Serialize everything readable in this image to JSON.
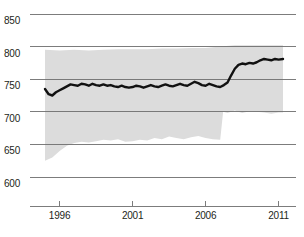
{
  "chart_data": {
    "type": "line",
    "title": "",
    "subtitle": "",
    "xlabel": "",
    "ylabel": "",
    "xlim": [
      1994.0,
      2011.6
    ],
    "ylim": [
      585,
      862
    ],
    "grid": true,
    "grid_axis": "y",
    "legend": false,
    "legend_position": "none",
    "colors": {
      "line": "#111111",
      "band_fill": "#dcdcdc",
      "gridline": "#6e6e6e",
      "axis": "#6e6e6e",
      "text": "#231f20",
      "background": "#ffffff"
    },
    "yticks": [
      600,
      650,
      700,
      750,
      800,
      850
    ],
    "ytick_labels": [
      "600",
      "650",
      "700",
      "750",
      "800",
      "850"
    ],
    "xticks": [
      1996,
      2001,
      2006,
      2011
    ],
    "xtick_labels": [
      "1996",
      "2001",
      "2006",
      "2011"
    ],
    "series": [
      {
        "name": "mean",
        "kind": "line",
        "x": [
          1995.0,
          1995.25,
          1995.5,
          1995.75,
          1996.0,
          1996.25,
          1996.5,
          1996.75,
          1997.0,
          1997.25,
          1997.5,
          1997.75,
          1998.0,
          1998.25,
          1998.5,
          1998.75,
          1999.0,
          1999.25,
          1999.5,
          1999.75,
          2000.0,
          2000.25,
          2000.5,
          2000.75,
          2001.0,
          2001.25,
          2001.5,
          2001.75,
          2002.0,
          2002.25,
          2002.5,
          2002.75,
          2003.0,
          2003.25,
          2003.5,
          2003.75,
          2004.0,
          2004.25,
          2004.5,
          2004.75,
          2005.0,
          2005.25,
          2005.5,
          2005.75,
          2006.0,
          2006.25,
          2006.5,
          2006.75,
          2007.0,
          2007.25,
          2007.5,
          2007.75,
          2008.0,
          2008.25,
          2008.5,
          2008.75,
          2009.0,
          2009.25,
          2009.5,
          2009.75,
          2010.0,
          2010.25,
          2010.5,
          2010.75,
          2011.0,
          2011.3
        ],
        "values": [
          735,
          727,
          725,
          730,
          733,
          736,
          739,
          742,
          741,
          740,
          743,
          742,
          740,
          743,
          741,
          740,
          742,
          740,
          741,
          739,
          738,
          740,
          738,
          737,
          738,
          740,
          739,
          737,
          739,
          741,
          739,
          738,
          740,
          742,
          740,
          739,
          741,
          743,
          741,
          740,
          743,
          746,
          744,
          741,
          740,
          743,
          741,
          739,
          738,
          741,
          745,
          756,
          766,
          772,
          774,
          773,
          775,
          774,
          776,
          779,
          781,
          780,
          779,
          781,
          780,
          781
        ]
      },
      {
        "name": "upper_band",
        "kind": "band_upper",
        "x": [
          1995.0,
          1996.0,
          1997.0,
          1998.0,
          1999.0,
          2000.0,
          2001.0,
          2002.0,
          2003.0,
          2004.0,
          2005.0,
          2006.0,
          2007.0,
          2008.0,
          2009.0,
          2010.0,
          2011.3
        ],
        "values": [
          795,
          794,
          795,
          794,
          795,
          796,
          796,
          796,
          797,
          797,
          798,
          798,
          800,
          802,
          802,
          802,
          802
        ]
      },
      {
        "name": "lower_band",
        "kind": "band_lower",
        "x": [
          1995.0,
          1995.5,
          1996.0,
          1996.5,
          1997.0,
          1997.5,
          1998.0,
          1998.5,
          1999.0,
          1999.5,
          2000.0,
          2000.5,
          2001.0,
          2001.5,
          2002.0,
          2002.5,
          2003.0,
          2003.5,
          2004.0,
          2004.5,
          2005.0,
          2005.5,
          2006.0,
          2006.5,
          2007.0,
          2007.2,
          2007.5,
          2008.0,
          2008.5,
          2009.0,
          2009.5,
          2010.0,
          2010.5,
          2011.0,
          2011.3
        ],
        "values": [
          625,
          630,
          640,
          648,
          652,
          654,
          653,
          655,
          657,
          656,
          658,
          654,
          655,
          657,
          656,
          660,
          658,
          662,
          660,
          658,
          661,
          663,
          660,
          658,
          657,
          700,
          698,
          702,
          698,
          701,
          700,
          699,
          697,
          699,
          699
        ]
      }
    ]
  },
  "axes": {
    "y_axis_name": "y-axis",
    "x_axis_name": "x-axis"
  }
}
